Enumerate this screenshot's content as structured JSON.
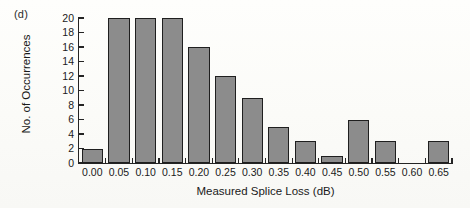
{
  "panel": {
    "label": "(d)"
  },
  "chart_data": {
    "type": "bar",
    "title": "",
    "subtitle": "",
    "xlabel": "Measured Splice Loss (dB)",
    "ylabel": "No. of Occurrences",
    "categories": [
      "0.00",
      "0.05",
      "0.10",
      "0.15",
      "0.20",
      "0.25",
      "0.30",
      "0.35",
      "0.40",
      "0.45",
      "0.50",
      "0.55",
      "0.60",
      "0.65"
    ],
    "values": [
      2,
      20,
      20,
      20,
      16,
      12,
      9,
      5,
      3,
      1,
      6,
      3,
      0,
      3
    ],
    "xlim": [
      0.0,
      0.65
    ],
    "ylim": [
      0,
      20
    ],
    "ytick_labels": [
      "0",
      "2",
      "4",
      "6",
      "8",
      "10",
      "12",
      "14",
      "16",
      "18",
      "20"
    ],
    "ytick_values": [
      0,
      2,
      4,
      6,
      8,
      10,
      12,
      14,
      16,
      18,
      20
    ],
    "xtick_labels": [
      "0.00",
      "0.05",
      "0.10",
      "0.15",
      "0.20",
      "0.25",
      "0.30",
      "0.35",
      "0.40",
      "0.45",
      "0.50",
      "0.55",
      "0.60",
      "0.65"
    ],
    "grid": false,
    "legend": null,
    "bar_color": "#8c8c8c",
    "bar_edge_color": "#1f1f1f",
    "axis_color": "#242424",
    "background_color": "#fdfdfb"
  }
}
